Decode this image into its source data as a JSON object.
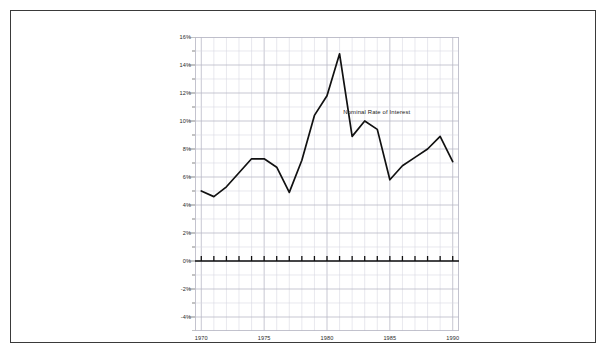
{
  "chart_data": {
    "type": "line",
    "title": "",
    "xlabel": "",
    "ylabel": "",
    "xlim": [
      1969.5,
      1990.5
    ],
    "ylim": [
      -5,
      16
    ],
    "grid": true,
    "legend_position": "inline-annotation",
    "annotations": [
      {
        "text": "Nominal Rate of Interest",
        "x": 1984.0,
        "y": 10.6
      }
    ],
    "x_tick_labels": [
      "1970",
      "1975",
      "1980",
      "1985",
      "1990"
    ],
    "x_tick_values": [
      1970,
      1975,
      1980,
      1985,
      1990
    ],
    "y_tick_labels": [
      "16%",
      "14%",
      "12%",
      "10%",
      "8%",
      "6%",
      "4%",
      "2%",
      "0%",
      "-2%",
      "-4%"
    ],
    "y_tick_values": [
      16,
      14,
      12,
      10,
      8,
      6,
      4,
      2,
      0,
      -2,
      -4
    ],
    "y_minor_step": 1,
    "x_minor_step": 1,
    "zero_axis_value": 0,
    "series": [
      {
        "name": "Nominal Rate of Interest",
        "color": "#111111",
        "x": [
          1970,
          1971,
          1972,
          1973,
          1974,
          1975,
          1976,
          1977,
          1978,
          1979,
          1980,
          1981,
          1982,
          1983,
          1984,
          1985,
          1986,
          1987,
          1988,
          1989,
          1990
        ],
        "values": [
          5.0,
          4.6,
          5.3,
          6.3,
          7.3,
          7.3,
          6.7,
          4.9,
          7.2,
          10.4,
          11.8,
          14.8,
          8.9,
          10.0,
          9.4,
          5.8,
          6.8,
          7.4,
          8.0,
          8.9,
          7.1
        ]
      }
    ]
  },
  "chart": {
    "series_label": "Nominal Rate of Interest"
  },
  "colors": {
    "border": "#3a3a3a",
    "grid_minor": "#d9d9e2",
    "grid_major": "#b9b9c6",
    "axis": "#111111",
    "line": "#111111",
    "background": "#ffffff"
  }
}
